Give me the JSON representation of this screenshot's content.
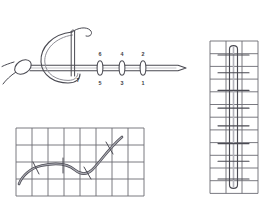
{
  "document": {
    "kind": "embroidery-stitch-instruction-diagram",
    "background_color": "#ffffff",
    "ink_color": "#4a4a52",
    "grid_color": "#6b6b73",
    "thread_highlight_color": "#8d8d95",
    "label_color": "#3c3c44"
  },
  "figures": [
    {
      "id": "needle-pass",
      "title": "Needle passing through fabric with numbered entry and exit points",
      "needle": {
        "shaft_y": 58,
        "shaft_x_start": 30,
        "shaft_x_end": 186,
        "tip_x": 186,
        "eye_x": 73
      },
      "stitch_points": [
        {
          "index": 0,
          "upper_label": "6",
          "lower_label": "5",
          "x": 100
        },
        {
          "index": 1,
          "upper_label": "4",
          "lower_label": "3",
          "x": 122
        },
        {
          "index": 2,
          "upper_label": "2",
          "lower_label": "1",
          "x": 143
        }
      ],
      "loop_label": "7",
      "loop_label_x": 77,
      "loop_label_y": 70,
      "knot": {
        "cx": 23,
        "cy": 57,
        "rx": 9,
        "ry": 6.5,
        "rotation": -34
      }
    },
    {
      "id": "grid-curve",
      "title": "Curved guideline couched on gridded canvas",
      "grid": {
        "columns": 8,
        "rows": 4,
        "cell_width": 16,
        "cell_height": 17
      },
      "couching_stitch_count": 4,
      "curve_description": "S-curve rising from lower-left to upper-right"
    },
    {
      "id": "grid-loop",
      "title": "Long vertical thread loop couched on gridded canvas",
      "grid": {
        "columns": 3,
        "rows": 12,
        "cell_width": 16,
        "cell_height": 12.7
      },
      "couching_stitch_count": 8,
      "loop_description": "Narrow elongated loop with rounded top and bottom"
    }
  ],
  "labels": {
    "upper_row": [
      "6",
      "4",
      "2"
    ],
    "lower_row": [
      "5",
      "3",
      "1"
    ],
    "loop": "7"
  }
}
